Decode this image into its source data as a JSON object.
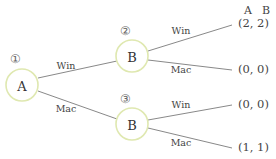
{
  "header": {
    "label_a": "A",
    "label_b": "B"
  },
  "nodes": [
    {
      "id": "n1",
      "number": "①",
      "label": "A"
    },
    {
      "id": "n2",
      "number": "②",
      "label": "B"
    },
    {
      "id": "n3",
      "number": "③",
      "label": "B"
    }
  ],
  "branches": {
    "n1_upper": "Win",
    "n1_lower": "Mac",
    "n2_upper": "Win",
    "n2_lower": "Mac",
    "n3_upper": "Win",
    "n3_lower": "Mac"
  },
  "payoffs": [
    "(2, 2)",
    "(0, 0)",
    "(0, 0)",
    "(1, 1)"
  ],
  "colors": {
    "node_stroke": "#dfe8b0",
    "edge": "#777777"
  }
}
